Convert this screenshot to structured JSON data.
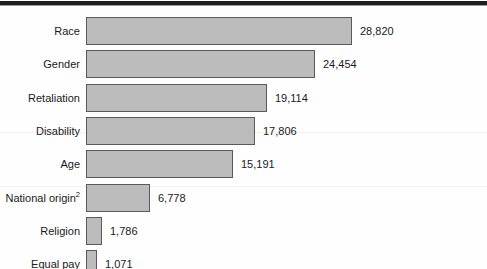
{
  "chart_data": {
    "type": "bar",
    "orientation": "horizontal",
    "title": "",
    "subtitle": "",
    "xlabel": "",
    "ylabel": "",
    "grid": false,
    "legend": null,
    "xlim": [
      0,
      28820
    ],
    "categories": [
      "Race",
      "Gender",
      "Retaliation",
      "Disability",
      "Age",
      "National origin",
      "Religion",
      "Equal pay"
    ],
    "values": [
      28820,
      24454,
      19114,
      17806,
      15191,
      6778,
      1786,
      1071
    ],
    "value_labels": [
      "28,820",
      "24,454",
      "19,114",
      "17,806",
      "15,191",
      "6,778",
      "1,786",
      "1,071"
    ],
    "category_footnotes": [
      "",
      "",
      "",
      "",
      "",
      "2",
      "",
      ""
    ],
    "bars": [
      {
        "label": "Race",
        "footnote": "",
        "value": 28820,
        "value_label": "28,820",
        "width_px": 266
      },
      {
        "label": "Gender",
        "footnote": "",
        "value": 24454,
        "value_label": "24,454",
        "width_px": 229
      },
      {
        "label": "Retaliation",
        "footnote": "",
        "value": 19114,
        "value_label": "19,114",
        "width_px": 181
      },
      {
        "label": "Disability",
        "footnote": "",
        "value": 17806,
        "value_label": "17,806",
        "width_px": 169
      },
      {
        "label": "Age",
        "footnote": "",
        "value": 15191,
        "value_label": "15,191",
        "width_px": 147
      },
      {
        "label": "National origin",
        "footnote": "2",
        "value": 6778,
        "value_label": "6,778",
        "width_px": 64
      },
      {
        "label": "Religion",
        "footnote": "",
        "value": 1786,
        "value_label": "1,786",
        "width_px": 16
      },
      {
        "label": "Equal pay",
        "footnote": "",
        "value": 1071,
        "value_label": "1,071",
        "width_px": 11
      }
    ],
    "colors": {
      "bar_fill": "#bcbcbc",
      "bar_border": "#5a5a5a",
      "text": "#1a1a1a",
      "background": "#fefefe",
      "top_rule": "#1d1d1d"
    }
  }
}
